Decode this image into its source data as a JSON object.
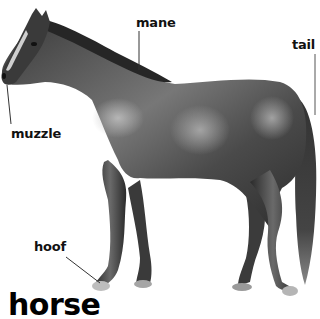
{
  "diagram": {
    "title": "horse",
    "subject": "horse",
    "labels": [
      {
        "id": "mane",
        "text": "mane"
      },
      {
        "id": "tail",
        "text": "tail"
      },
      {
        "id": "muzzle",
        "text": "muzzle"
      },
      {
        "id": "hoof",
        "text": "hoof"
      }
    ],
    "colors": {
      "background": "#ffffff",
      "label_text": "#111111",
      "leader_line": "#333333",
      "horse_dark": "#2a2a2a",
      "horse_mid": "#5a5a5a",
      "horse_light": "#a8a8a8"
    }
  }
}
